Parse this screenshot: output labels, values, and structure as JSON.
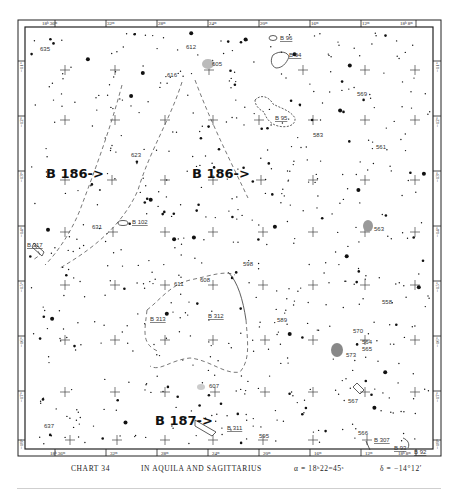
{
  "chart": {
    "number_label": "CHART 34",
    "title": "IN AQUILA AND SAGITTARIUS",
    "ra_center": "α = 18ʰ22ᵐ45ˢ",
    "dec_center": "δ = −14°12′"
  },
  "ra_ticks_top": [
    "18ʰ 36ᵐ",
    "32ᵐ",
    "28ᵐ",
    "24ᵐ",
    "20ᵐ",
    "16ᵐ",
    "12ᵐ",
    "18ʰ 8ᵐ"
  ],
  "ra_ticks_bottom": [
    "18ʰ 36ᵐ",
    "32ᵐ",
    "28ᵐ",
    "24ᵐ",
    "20ᵐ",
    "16ᵐ",
    "12ᵐ",
    "18ʰ 8ᵐ"
  ],
  "dec_ticks_left": [
    "−11°",
    "−12°",
    "−13°",
    "−14°",
    "−15°",
    "−16°",
    "−17°",
    "−18°"
  ],
  "dec_ticks_right": [
    "−11°",
    "−12°",
    "−13°",
    "−14°",
    "−15°",
    "−16°",
    "−17°",
    "−18°"
  ],
  "annotations": {
    "b186_left": "B 186->",
    "b186_right": "B 186->",
    "b187": "B 187->"
  },
  "barnard_objects": [
    {
      "id": "b96",
      "label": "B 96"
    },
    {
      "id": "b94",
      "label": "B 94"
    },
    {
      "id": "b95",
      "label": "B 95"
    },
    {
      "id": "b102",
      "label": "B 102"
    },
    {
      "id": "b312",
      "label": "B 312"
    },
    {
      "id": "b313",
      "label": "B 313"
    },
    {
      "id": "b311",
      "label": "B 311"
    },
    {
      "id": "b307",
      "label": "B 307"
    },
    {
      "id": "b93",
      "label": "B 93"
    },
    {
      "id": "b92",
      "label": "B 92"
    },
    {
      "id": "b317",
      "label": "B 317"
    }
  ],
  "catalog_objects": [
    {
      "id": "635",
      "label": "635"
    },
    {
      "id": "612",
      "label": "612"
    },
    {
      "id": "605",
      "label": "605"
    },
    {
      "id": "616",
      "label": "616"
    },
    {
      "id": "569",
      "label": "569"
    },
    {
      "id": "583",
      "label": "583"
    },
    {
      "id": "561",
      "label": "561"
    },
    {
      "id": "623",
      "label": "623"
    },
    {
      "id": "631",
      "label": "631"
    },
    {
      "id": "563",
      "label": "563"
    },
    {
      "id": "598",
      "label": "598"
    },
    {
      "id": "611",
      "label": "611"
    },
    {
      "id": "608",
      "label": "608"
    },
    {
      "id": "558",
      "label": "558"
    },
    {
      "id": "589",
      "label": "589"
    },
    {
      "id": "570",
      "label": "570"
    },
    {
      "id": "564",
      "label": "564"
    },
    {
      "id": "565",
      "label": "565"
    },
    {
      "id": "573",
      "label": "573"
    },
    {
      "id": "607",
      "label": "607"
    },
    {
      "id": "567",
      "label": "567"
    },
    {
      "id": "637",
      "label": "637"
    },
    {
      "id": "595",
      "label": "595"
    },
    {
      "id": "566",
      "label": "566"
    }
  ]
}
